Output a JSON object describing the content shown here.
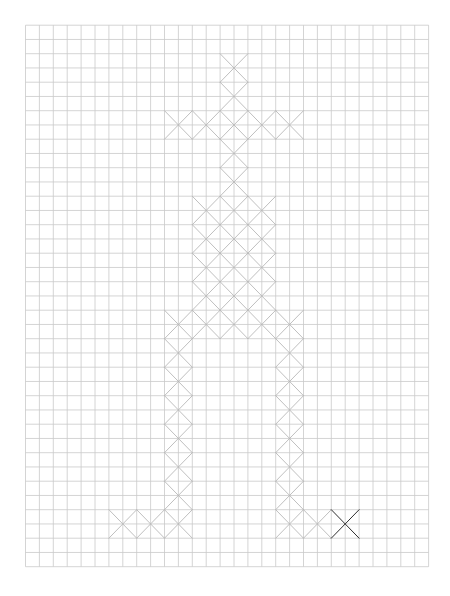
{
  "canvas": {
    "width": 450,
    "height": 596,
    "background": "#ffffff"
  },
  "grid": {
    "origin_x": 25.5,
    "origin_y": 25.2,
    "cell_w": 13.9,
    "cell_h": 14.25,
    "cols": 29,
    "rows": 38,
    "line_color": "#c9c9c9"
  },
  "stitches": {
    "color": "#b8b8b8",
    "highlight_color": "#2e2e2e",
    "span_cells": 2,
    "centers": [
      {
        "i": 15,
        "j": 3
      },
      {
        "i": 15,
        "j": 5
      },
      {
        "i": 11,
        "j": 7
      },
      {
        "i": 13,
        "j": 7
      },
      {
        "i": 15,
        "j": 7
      },
      {
        "i": 17,
        "j": 7
      },
      {
        "i": 19,
        "j": 7
      },
      {
        "i": 15,
        "j": 9
      },
      {
        "i": 15,
        "j": 11
      },
      {
        "i": 13,
        "j": 13
      },
      {
        "i": 15,
        "j": 13
      },
      {
        "i": 17,
        "j": 13
      },
      {
        "i": 13,
        "j": 15
      },
      {
        "i": 15,
        "j": 15
      },
      {
        "i": 17,
        "j": 15
      },
      {
        "i": 13,
        "j": 17
      },
      {
        "i": 15,
        "j": 17
      },
      {
        "i": 17,
        "j": 17
      },
      {
        "i": 13,
        "j": 19
      },
      {
        "i": 15,
        "j": 19
      },
      {
        "i": 17,
        "j": 19
      },
      {
        "i": 11,
        "j": 21
      },
      {
        "i": 13,
        "j": 21
      },
      {
        "i": 15,
        "j": 21
      },
      {
        "i": 17,
        "j": 21
      },
      {
        "i": 19,
        "j": 21
      },
      {
        "i": 11,
        "j": 23
      },
      {
        "i": 19,
        "j": 23
      },
      {
        "i": 11,
        "j": 25
      },
      {
        "i": 19,
        "j": 25
      },
      {
        "i": 11,
        "j": 27
      },
      {
        "i": 19,
        "j": 27
      },
      {
        "i": 11,
        "j": 29
      },
      {
        "i": 19,
        "j": 29
      },
      {
        "i": 11,
        "j": 31
      },
      {
        "i": 19,
        "j": 31
      },
      {
        "i": 11,
        "j": 33
      },
      {
        "i": 19,
        "j": 33
      },
      {
        "i": 7,
        "j": 35
      },
      {
        "i": 9,
        "j": 35
      },
      {
        "i": 11,
        "j": 35
      },
      {
        "i": 19,
        "j": 35
      },
      {
        "i": 21,
        "j": 35
      },
      {
        "i": 23,
        "j": 35,
        "highlight": true
      }
    ]
  }
}
